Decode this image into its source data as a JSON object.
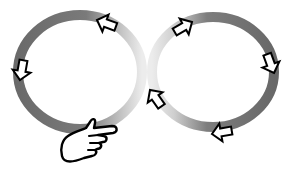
{
  "diagram": {
    "type": "infinity-loop",
    "colors": {
      "ring_dark": "#6e6e6e",
      "ring_light": "#e6e6e6",
      "arrow_fill": "#ffffff",
      "arrow_stroke": "#000000",
      "background": "#ffffff"
    },
    "rings": [
      {
        "name": "left-loop",
        "cx": 80,
        "cy": 72,
        "rx": 63,
        "ry": 58
      },
      {
        "name": "right-loop",
        "cx": 213,
        "cy": 72,
        "rx": 62,
        "ry": 56
      }
    ],
    "arrows": [
      {
        "name": "left-loop-top-arrow",
        "x": 108,
        "y": 24,
        "direction": "left"
      },
      {
        "name": "left-loop-left-arrow",
        "x": 21,
        "y": 68,
        "direction": "down"
      },
      {
        "name": "right-loop-top-arrow",
        "x": 178,
        "y": 31,
        "direction": "up-right"
      },
      {
        "name": "right-loop-right-arrow",
        "x": 268,
        "y": 60,
        "direction": "down"
      },
      {
        "name": "right-loop-bottom-arrow",
        "x": 227,
        "y": 132,
        "direction": "left"
      },
      {
        "name": "crossing-arrow",
        "x": 157,
        "y": 101,
        "direction": "up-left"
      }
    ],
    "hand": {
      "name": "pointing-hand",
      "x": 60,
      "y": 118,
      "direction": "right"
    }
  }
}
